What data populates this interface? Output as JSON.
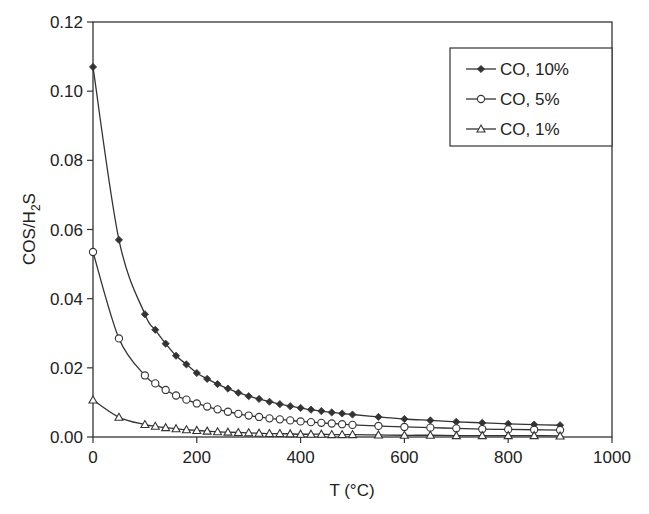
{
  "chart_data": {
    "type": "line",
    "title": "",
    "xlabel": "T (°C)",
    "ylabel": "COS/H2S",
    "ylabel_parts": {
      "main": "COS/H",
      "sub": "2",
      "tail": "S"
    },
    "xlim": [
      0,
      1000
    ],
    "ylim": [
      0,
      0.12
    ],
    "xticks": [
      0,
      200,
      400,
      600,
      800,
      1000
    ],
    "xtick_labels": [
      "0",
      "200",
      "400",
      "600",
      "800",
      "1000"
    ],
    "yticks": [
      0,
      0.02,
      0.04,
      0.06,
      0.08,
      0.1,
      0.12
    ],
    "ytick_labels": [
      "0.00",
      "0.02",
      "0.04",
      "0.06",
      "0.08",
      "0.10",
      "0.12"
    ],
    "grid": false,
    "legend_position": "upper right",
    "x": [
      0,
      50,
      100,
      120,
      140,
      160,
      180,
      200,
      220,
      240,
      260,
      280,
      300,
      320,
      340,
      360,
      380,
      400,
      420,
      440,
      460,
      480,
      500,
      550,
      600,
      650,
      700,
      750,
      800,
      850,
      900
    ],
    "series": [
      {
        "name": "CO, 10%",
        "marker": "diamond-filled",
        "values": [
          0.107,
          0.057,
          0.0355,
          0.031,
          0.027,
          0.0235,
          0.021,
          0.0185,
          0.0168,
          0.0153,
          0.014,
          0.0128,
          0.0118,
          0.011,
          0.0102,
          0.0095,
          0.0089,
          0.0084,
          0.0079,
          0.0075,
          0.0071,
          0.0068,
          0.0065,
          0.0058,
          0.0052,
          0.0048,
          0.0044,
          0.0041,
          0.0038,
          0.0036,
          0.0034
        ]
      },
      {
        "name": "CO, 5%",
        "marker": "circle-open",
        "values": [
          0.0535,
          0.0285,
          0.0178,
          0.0155,
          0.0136,
          0.012,
          0.0108,
          0.0097,
          0.0088,
          0.008,
          0.0073,
          0.0067,
          0.0062,
          0.0058,
          0.0054,
          0.0051,
          0.0048,
          0.0045,
          0.0043,
          0.0041,
          0.0039,
          0.0037,
          0.0035,
          0.0032,
          0.0029,
          0.0027,
          0.0025,
          0.0023,
          0.0022,
          0.0021,
          0.002
        ]
      },
      {
        "name": "CO, 1%",
        "marker": "triangle-open",
        "values": [
          0.0107,
          0.0057,
          0.0036,
          0.0031,
          0.0027,
          0.0024,
          0.0021,
          0.0019,
          0.0017,
          0.0015,
          0.0014,
          0.0013,
          0.0012,
          0.0011,
          0.001,
          0.001,
          0.0009,
          0.0008,
          0.0008,
          0.0008,
          0.0007,
          0.0007,
          0.0007,
          0.0006,
          0.0005,
          0.0005,
          0.0004,
          0.0004,
          0.0004,
          0.0004,
          0.0003
        ]
      }
    ]
  },
  "colors": {
    "line": "#333333",
    "axis": "#333333",
    "text": "#222222",
    "background": "#ffffff"
  }
}
